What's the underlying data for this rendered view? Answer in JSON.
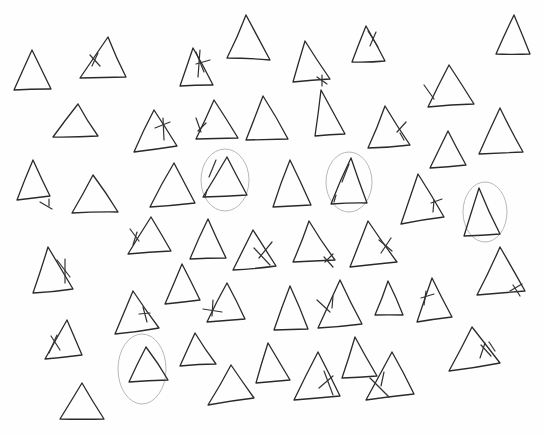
{
  "canvas": {
    "width": 544,
    "height": 435,
    "background": "#fefefe",
    "ink": "#2a2a2a",
    "circle_ink": "#b9b9b9"
  },
  "triangles": [
    {
      "apex": [
        32,
        50
      ],
      "bl": [
        14,
        90
      ],
      "br": [
        51,
        89
      ],
      "marks": [],
      "circled": false
    },
    {
      "apex": [
        108,
        37
      ],
      "bl": [
        80,
        78
      ],
      "br": [
        126,
        77
      ],
      "marks": [
        [
          [
            90,
            55
          ],
          [
            100,
            66
          ]
        ],
        [
          [
            92,
            66
          ],
          [
            98,
            53
          ]
        ]
      ],
      "circled": false
    },
    {
      "apex": [
        193,
        48
      ],
      "bl": [
        180,
        86
      ],
      "br": [
        213,
        85
      ],
      "marks": [
        [
          [
            196,
            52
          ],
          [
            204,
            72
          ]
        ],
        [
          [
            200,
            50
          ],
          [
            198,
            77
          ]
        ],
        [
          [
            196,
            64
          ],
          [
            210,
            60
          ]
        ]
      ],
      "circled": false
    },
    {
      "apex": [
        246,
        15
      ],
      "bl": [
        227,
        58
      ],
      "br": [
        270,
        60
      ],
      "marks": [],
      "circled": false
    },
    {
      "apex": [
        305,
        41
      ],
      "bl": [
        293,
        82
      ],
      "br": [
        330,
        79
      ],
      "marks": [
        [
          [
            317,
            77
          ],
          [
            327,
            84
          ]
        ],
        [
          [
            322,
            75
          ],
          [
            322,
            86
          ]
        ]
      ],
      "circled": false
    },
    {
      "apex": [
        366,
        26
      ],
      "bl": [
        352,
        62
      ],
      "br": [
        385,
        61
      ],
      "marks": [
        [
          [
            368,
            31
          ],
          [
            378,
            47
          ]
        ],
        [
          [
            376,
            32
          ],
          [
            370,
            46
          ]
        ]
      ],
      "circled": false
    },
    {
      "apex": [
        514,
        15
      ],
      "bl": [
        496,
        54
      ],
      "br": [
        530,
        54
      ],
      "marks": [],
      "circled": false
    },
    {
      "apex": [
        78,
        104
      ],
      "bl": [
        53,
        137
      ],
      "br": [
        98,
        136
      ],
      "marks": [],
      "circled": false
    },
    {
      "apex": [
        154,
        110
      ],
      "bl": [
        134,
        152
      ],
      "br": [
        177,
        146
      ],
      "marks": [
        [
          [
            155,
            128
          ],
          [
            170,
            122
          ]
        ],
        [
          [
            163,
            118
          ],
          [
            164,
            140
          ]
        ]
      ],
      "circled": false
    },
    {
      "apex": [
        214,
        100
      ],
      "bl": [
        196,
        139
      ],
      "br": [
        238,
        138
      ],
      "marks": [
        [
          [
            196,
            118
          ],
          [
            201,
            132
          ]
        ],
        [
          [
            198,
            131
          ],
          [
            206,
            123
          ]
        ]
      ],
      "circled": false
    },
    {
      "apex": [
        263,
        96
      ],
      "bl": [
        246,
        140
      ],
      "br": [
        288,
        139
      ],
      "marks": [],
      "circled": false
    },
    {
      "apex": [
        321,
        90
      ],
      "bl": [
        315,
        136
      ],
      "br": [
        345,
        134
      ],
      "marks": [],
      "circled": false
    },
    {
      "apex": [
        385,
        106
      ],
      "bl": [
        368,
        148
      ],
      "br": [
        410,
        145
      ],
      "marks": [
        [
          [
            397,
            132
          ],
          [
            406,
            122
          ]
        ],
        [
          [
            400,
            133
          ],
          [
            404,
            140
          ]
        ]
      ],
      "circled": false
    },
    {
      "apex": [
        449,
        65
      ],
      "bl": [
        428,
        107
      ],
      "br": [
        474,
        104
      ],
      "marks": [
        [
          [
            424,
            85
          ],
          [
            434,
            99
          ]
        ]
      ],
      "circled": false
    },
    {
      "apex": [
        448,
        131
      ],
      "bl": [
        430,
        168
      ],
      "br": [
        466,
        165
      ],
      "marks": [],
      "circled": false
    },
    {
      "apex": [
        500,
        108
      ],
      "bl": [
        479,
        154
      ],
      "br": [
        523,
        152
      ],
      "marks": [],
      "circled": false
    },
    {
      "apex": [
        33,
        160
      ],
      "bl": [
        17,
        200
      ],
      "br": [
        50,
        196
      ],
      "marks": [
        [
          [
            40,
            202
          ],
          [
            52,
            209
          ]
        ],
        [
          [
            49,
            199
          ],
          [
            49,
            206
          ]
        ]
      ],
      "circled": false
    },
    {
      "apex": [
        93,
        175
      ],
      "bl": [
        72,
        213
      ],
      "br": [
        118,
        212
      ],
      "marks": [],
      "circled": false
    },
    {
      "apex": [
        174,
        163
      ],
      "bl": [
        150,
        207
      ],
      "br": [
        195,
        203
      ],
      "marks": [],
      "circled": false
    },
    {
      "apex": [
        227,
        157
      ],
      "bl": [
        203,
        197
      ],
      "br": [
        247,
        195
      ],
      "marks": [
        [
          [
            216,
            160
          ],
          [
            209,
            177
          ]
        ],
        [
          [
            207,
            190
          ],
          [
            205,
            197
          ]
        ]
      ],
      "circled": true,
      "circle": {
        "cx": 225,
        "cy": 180,
        "rx": 24,
        "ry": 31
      }
    },
    {
      "apex": [
        290,
        160
      ],
      "bl": [
        273,
        207
      ],
      "br": [
        311,
        205
      ],
      "marks": [],
      "circled": false
    },
    {
      "apex": [
        351,
        158
      ],
      "bl": [
        331,
        204
      ],
      "br": [
        367,
        203
      ],
      "marks": [
        [
          [
            349,
            164
          ],
          [
            342,
            182
          ]
        ],
        [
          [
            336,
            195
          ],
          [
            334,
            202
          ]
        ]
      ],
      "circled": true,
      "circle": {
        "cx": 349,
        "cy": 182,
        "rx": 23,
        "ry": 30
      }
    },
    {
      "apex": [
        418,
        174
      ],
      "bl": [
        401,
        224
      ],
      "br": [
        444,
        217
      ],
      "marks": [
        [
          [
            431,
            203
          ],
          [
            442,
            199
          ]
        ],
        [
          [
            434,
            200
          ],
          [
            433,
            212
          ]
        ]
      ],
      "circled": false
    },
    {
      "apex": [
        479,
        188
      ],
      "bl": [
        464,
        236
      ],
      "br": [
        500,
        234
      ],
      "marks": [],
      "circled": true,
      "circle": {
        "cx": 485,
        "cy": 212,
        "rx": 22,
        "ry": 30
      }
    },
    {
      "apex": [
        151,
        217
      ],
      "bl": [
        128,
        254
      ],
      "br": [
        171,
        251
      ],
      "marks": [
        [
          [
            130,
            229
          ],
          [
            139,
            241
          ]
        ],
        [
          [
            137,
            232
          ],
          [
            133,
            245
          ]
        ]
      ],
      "circled": false
    },
    {
      "apex": [
        208,
        219
      ],
      "bl": [
        190,
        259
      ],
      "br": [
        226,
        258
      ],
      "marks": [],
      "circled": false
    },
    {
      "apex": [
        253,
        230
      ],
      "bl": [
        233,
        270
      ],
      "br": [
        276,
        266
      ],
      "marks": [
        [
          [
            254,
            248
          ],
          [
            270,
            265
          ]
        ],
        [
          [
            272,
            242
          ],
          [
            259,
            258
          ]
        ]
      ],
      "circled": false
    },
    {
      "apex": [
        309,
        221
      ],
      "bl": [
        293,
        262
      ],
      "br": [
        335,
        260
      ],
      "marks": [
        [
          [
            324,
            257
          ],
          [
            333,
            267
          ]
        ],
        [
          [
            333,
            254
          ],
          [
            325,
            262
          ]
        ]
      ],
      "circled": false
    },
    {
      "apex": [
        368,
        221
      ],
      "bl": [
        350,
        267
      ],
      "br": [
        397,
        262
      ],
      "marks": [
        [
          [
            379,
            240
          ],
          [
            392,
            251
          ]
        ],
        [
          [
            391,
            238
          ],
          [
            381,
            253
          ]
        ]
      ],
      "circled": false
    },
    {
      "apex": [
        48,
        247
      ],
      "bl": [
        33,
        293
      ],
      "br": [
        73,
        289
      ],
      "marks": [
        [
          [
            57,
            260
          ],
          [
            70,
            277
          ]
        ],
        [
          [
            65,
            259
          ],
          [
            65,
            283
          ]
        ]
      ],
      "circled": false
    },
    {
      "apex": [
        182,
        264
      ],
      "bl": [
        165,
        304
      ],
      "br": [
        200,
        300
      ],
      "marks": [],
      "circled": false
    },
    {
      "apex": [
        500,
        247
      ],
      "bl": [
        477,
        295
      ],
      "br": [
        525,
        291
      ],
      "marks": [
        [
          [
            513,
            285
          ],
          [
            520,
            296
          ]
        ],
        [
          [
            510,
            291
          ],
          [
            522,
            284
          ]
        ]
      ],
      "circled": false
    },
    {
      "apex": [
        133,
        291
      ],
      "bl": [
        115,
        334
      ],
      "br": [
        159,
        328
      ],
      "marks": [
        [
          [
            143,
            307
          ],
          [
            147,
            322
          ]
        ],
        [
          [
            139,
            314
          ],
          [
            150,
            313
          ]
        ]
      ],
      "circled": false
    },
    {
      "apex": [
        227,
        283
      ],
      "bl": [
        207,
        322
      ],
      "br": [
        245,
        319
      ],
      "marks": [
        [
          [
            203,
            309
          ],
          [
            222,
            312
          ]
        ],
        [
          [
            213,
            300
          ],
          [
            212,
            316
          ]
        ]
      ],
      "circled": false
    },
    {
      "apex": [
        290,
        286
      ],
      "bl": [
        274,
        330
      ],
      "br": [
        308,
        329
      ],
      "marks": [],
      "circled": false
    },
    {
      "apex": [
        340,
        280
      ],
      "bl": [
        318,
        328
      ],
      "br": [
        362,
        324
      ],
      "marks": [
        [
          [
            317,
            300
          ],
          [
            330,
            312
          ]
        ],
        [
          [
            333,
            296
          ],
          [
            332,
            308
          ]
        ]
      ],
      "circled": false
    },
    {
      "apex": [
        388,
        281
      ],
      "bl": [
        375,
        315
      ],
      "br": [
        403,
        315
      ],
      "marks": [],
      "circled": false
    },
    {
      "apex": [
        432,
        278
      ],
      "bl": [
        417,
        322
      ],
      "br": [
        452,
        317
      ],
      "marks": [
        [
          [
            421,
            298
          ],
          [
            434,
            294
          ]
        ],
        [
          [
            426,
            291
          ],
          [
            424,
            305
          ]
        ]
      ],
      "circled": false
    },
    {
      "apex": [
        67,
        320
      ],
      "bl": [
        45,
        359
      ],
      "br": [
        82,
        355
      ],
      "marks": [
        [
          [
            51,
            336
          ],
          [
            60,
            350
          ]
        ],
        [
          [
            57,
            335
          ],
          [
            49,
            353
          ]
        ]
      ],
      "circled": false
    },
    {
      "apex": [
        146,
        347
      ],
      "bl": [
        129,
        382
      ],
      "br": [
        168,
        380
      ],
      "marks": [],
      "circled": true,
      "circle": {
        "cx": 142,
        "cy": 369,
        "rx": 24,
        "ry": 35
      }
    },
    {
      "apex": [
        195,
        333
      ],
      "bl": [
        180,
        366
      ],
      "br": [
        216,
        364
      ],
      "marks": [],
      "circled": false
    },
    {
      "apex": [
        268,
        343
      ],
      "bl": [
        256,
        383
      ],
      "br": [
        290,
        380
      ],
      "marks": [],
      "circled": false
    },
    {
      "apex": [
        472,
        327
      ],
      "bl": [
        449,
        371
      ],
      "br": [
        500,
        363
      ],
      "marks": [
        [
          [
            481,
            345
          ],
          [
            491,
            356
          ]
        ],
        [
          [
            485,
            343
          ],
          [
            480,
            358
          ]
        ],
        [
          [
            489,
            342
          ],
          [
            495,
            351
          ]
        ]
      ],
      "circled": false
    },
    {
      "apex": [
        355,
        337
      ],
      "bl": [
        342,
        378
      ],
      "br": [
        377,
        376
      ],
      "marks": [],
      "circled": false
    },
    {
      "apex": [
        231,
        365
      ],
      "bl": [
        208,
        405
      ],
      "br": [
        254,
        398
      ],
      "marks": [],
      "circled": false
    },
    {
      "apex": [
        318,
        352
      ],
      "bl": [
        294,
        400
      ],
      "br": [
        340,
        396
      ],
      "marks": [
        [
          [
            324,
            371
          ],
          [
            333,
            395
          ]
        ],
        [
          [
            319,
            388
          ],
          [
            333,
            376
          ]
        ]
      ],
      "circled": false
    },
    {
      "apex": [
        392,
        352
      ],
      "bl": [
        366,
        400
      ],
      "br": [
        414,
        394
      ],
      "marks": [
        [
          [
            370,
            378
          ],
          [
            389,
            397
          ]
        ],
        [
          [
            381,
            386
          ],
          [
            384,
            372
          ]
        ]
      ],
      "circled": false
    },
    {
      "apex": [
        82,
        383
      ],
      "bl": [
        60,
        419
      ],
      "br": [
        104,
        419
      ],
      "marks": [],
      "circled": false
    }
  ]
}
